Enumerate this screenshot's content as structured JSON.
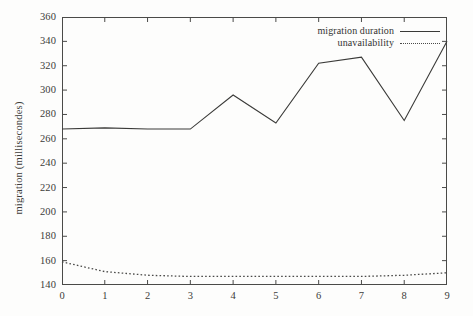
{
  "chart_data": {
    "type": "line",
    "title": "",
    "subtitle": "",
    "xlabel": "",
    "ylabel": "migration (millisecondes)",
    "x": [
      0,
      1,
      2,
      3,
      4,
      5,
      6,
      7,
      8,
      9
    ],
    "xlim": [
      0,
      9
    ],
    "ylim": [
      140,
      360
    ],
    "xticks": [
      "0",
      "1",
      "2",
      "3",
      "4",
      "5",
      "6",
      "7",
      "8",
      "9"
    ],
    "yticks": [
      "140",
      "160",
      "180",
      "200",
      "220",
      "240",
      "260",
      "280",
      "300",
      "320",
      "340",
      "360"
    ],
    "grid": false,
    "legend_position": "top-right-inside",
    "series": [
      {
        "name": "migration duration",
        "style": "solid",
        "color": "#3a3a38",
        "values": [
          268,
          269,
          268,
          268,
          296,
          273,
          322,
          327,
          275,
          340
        ]
      },
      {
        "name": "unavailability",
        "style": "dotted",
        "color": "#4a4a48",
        "values": [
          159,
          151,
          148,
          147,
          147,
          147,
          147,
          147,
          148,
          150
        ]
      }
    ]
  },
  "legend": {
    "entries": [
      {
        "label": "migration duration",
        "style": "solid"
      },
      {
        "label": "unavailability",
        "style": "dotted"
      }
    ]
  }
}
